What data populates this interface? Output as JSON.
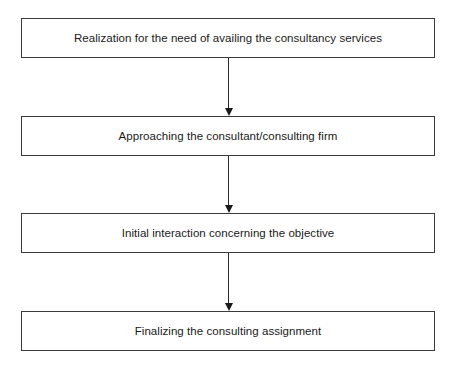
{
  "diagram": {
    "type": "flowchart",
    "direction": "top-to-bottom",
    "steps": [
      {
        "label": "Realization for the need of availing the consultancy services"
      },
      {
        "label": "Approaching the consultant/consulting firm"
      },
      {
        "label": "Initial interaction concerning the objective"
      },
      {
        "label": "Finalizing the consulting assignment"
      }
    ],
    "connectors": [
      {
        "from": 0,
        "to": 1
      },
      {
        "from": 1,
        "to": 2
      },
      {
        "from": 2,
        "to": 3
      }
    ],
    "colors": {
      "border": "#3a3a3a",
      "text": "#1a1a1a",
      "background": "#ffffff"
    }
  }
}
